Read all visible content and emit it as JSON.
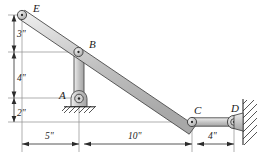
{
  "figure": {
    "background_color": "#ffffff",
    "metal_fill_color": "#c8c8c8",
    "metal_edge_color": "#4a4a4a",
    "ink_color": "#1a1a1a",
    "dimension_line_color": "#2b2b2b",
    "extension_line_color": "#8c8c8c"
  },
  "joints": [
    {
      "id": "E",
      "label": "E",
      "x": 22,
      "y": 15,
      "label_x": 33,
      "label_y": 11,
      "type": "free-end-pin"
    },
    {
      "id": "B",
      "label": "B",
      "x": 78,
      "y": 52,
      "label_x": 89,
      "label_y": 47,
      "type": "pin"
    },
    {
      "id": "A",
      "label": "A",
      "x": 79,
      "y": 98,
      "label_x": 63,
      "label_y": 96,
      "type": "fixed-pin-support"
    },
    {
      "id": "C",
      "label": "C",
      "x": 192,
      "y": 122,
      "label_x": 194,
      "label_y": 112,
      "type": "pin"
    },
    {
      "id": "D",
      "label": "D",
      "x": 234,
      "y": 122,
      "label_x": 234,
      "label_y": 110,
      "type": "wall-pin"
    }
  ],
  "members": [
    {
      "id": "EC",
      "from": "E",
      "to": "C",
      "name": "main-diagonal-bar",
      "half_width": 4.2
    },
    {
      "id": "BA",
      "from": "B",
      "to": "A",
      "name": "vertical-link",
      "half_width": 4.0
    },
    {
      "id": "CD",
      "from": "C",
      "to": "D",
      "name": "horizontal-link",
      "half_width": 4.0
    }
  ],
  "supports": {
    "ground_pin": {
      "at": "A",
      "name": "pin-support-A",
      "hatch_y": 108,
      "hatch_x1": 64,
      "hatch_x2": 95
    },
    "wall": {
      "at": "D",
      "name": "wall-support-D",
      "x": 244,
      "y1": 100,
      "y2": 144
    }
  },
  "dimensions": {
    "vertical": [
      {
        "id": "v3",
        "label": "3\"",
        "value": 3,
        "unit": "in",
        "from_y": 15,
        "to_y": 52,
        "axis_x": 14,
        "text_x": 18,
        "text_y": 37
      },
      {
        "id": "v4",
        "label": "4\"",
        "value": 4,
        "unit": "in",
        "from_y": 52,
        "to_y": 98,
        "axis_x": 14,
        "text_x": 18,
        "text_y": 79
      },
      {
        "id": "v2",
        "label": "2\"",
        "value": 2,
        "unit": "in",
        "from_y": 98,
        "to_y": 122,
        "axis_x": 14,
        "text_x": 18,
        "text_y": 114
      }
    ],
    "horizontal": [
      {
        "id": "h5",
        "label": "5\"",
        "value": 5,
        "unit": "in",
        "from_x": 22,
        "to_x": 79,
        "axis_y": 144,
        "text_x": 50,
        "text_y": 139
      },
      {
        "id": "h10",
        "label": "10\"",
        "value": 10,
        "unit": "in",
        "from_x": 79,
        "to_x": 192,
        "axis_y": 144,
        "text_x": 135,
        "text_y": 139
      },
      {
        "id": "h4",
        "label": "4\"",
        "value": 4,
        "unit": "in",
        "from_x": 192,
        "to_x": 234,
        "axis_y": 144,
        "text_x": 213,
        "text_y": 139
      }
    ]
  },
  "extension_lines": {
    "horizontal": [
      {
        "id": "ext-E",
        "y": 15,
        "x1": 8,
        "x2": 28
      },
      {
        "id": "ext-B",
        "y": 52,
        "x1": 8,
        "x2": 82
      },
      {
        "id": "ext-A",
        "y": 98,
        "x1": 8,
        "x2": 72
      },
      {
        "id": "ext-C",
        "y": 122,
        "x1": 8,
        "x2": 196
      }
    ],
    "vertical": [
      {
        "id": "ext-v-E",
        "x": 22,
        "y1": 20,
        "y2": 152
      },
      {
        "id": "ext-v-A",
        "x": 79,
        "y1": 52,
        "y2": 152
      },
      {
        "id": "ext-v-C",
        "x": 192,
        "y1": 126,
        "y2": 152
      },
      {
        "id": "ext-v-D",
        "x": 234,
        "y1": 126,
        "y2": 152
      }
    ]
  }
}
